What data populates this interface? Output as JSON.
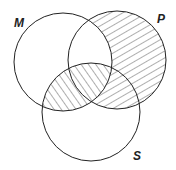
{
  "diagram": {
    "type": "venn",
    "sets": [
      {
        "id": "M",
        "label": "M",
        "cx": 63,
        "cy": 62,
        "r": 49,
        "label_x": 14,
        "label_y": 27
      },
      {
        "id": "P",
        "label": "P",
        "cx": 117,
        "cy": 60,
        "r": 49,
        "label_x": 157,
        "label_y": 23
      },
      {
        "id": "S",
        "label": "S",
        "cx": 91,
        "cy": 112,
        "r": 49,
        "label_x": 133,
        "label_y": 160
      }
    ],
    "shaded_regions": [
      {
        "region": "P only and P∩S (not M)",
        "hatch": "forward-slash"
      },
      {
        "region": "M∩S (including M∩P∩S)",
        "hatch": "back-slash"
      }
    ],
    "stroke_color": "#222222",
    "hatch_color": "#333333"
  }
}
